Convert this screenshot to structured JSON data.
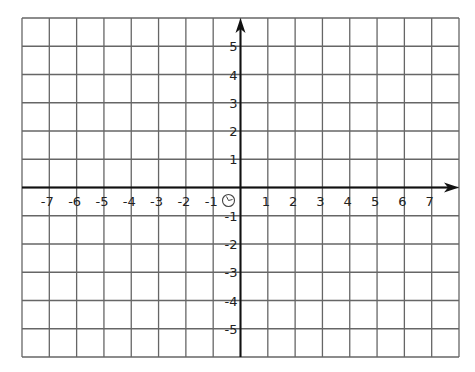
{
  "diagram": {
    "type": "coordinate-plane",
    "grid": {
      "x_min": -8,
      "x_max": 8,
      "y_min": -6,
      "y_max": 6,
      "left": 22,
      "right": 459,
      "top": 18,
      "bottom": 357,
      "line_color": "#666666",
      "axis_color": "#111111"
    },
    "x_axis": {
      "labels": [
        "-7",
        "-6",
        "-5",
        "-4",
        "-3",
        "-2",
        "-1",
        "1",
        "2",
        "3",
        "4",
        "5",
        "6",
        "7"
      ],
      "values": [
        -7,
        -6,
        -5,
        -4,
        -3,
        -2,
        -1,
        1,
        2,
        3,
        4,
        5,
        6,
        7
      ]
    },
    "y_axis": {
      "labels": [
        "5",
        "4",
        "3",
        "2",
        "1",
        "-1",
        "-2",
        "-3",
        "-4",
        "-5"
      ],
      "values": [
        5,
        4,
        3,
        2,
        1,
        -1,
        -2,
        -3,
        -4,
        -5
      ]
    },
    "origin_label": "O"
  }
}
